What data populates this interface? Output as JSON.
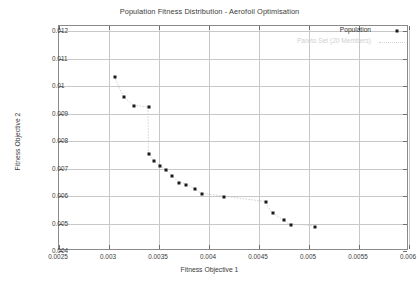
{
  "chart_data": {
    "type": "scatter",
    "title": "Population Fitness Distribution - Aerofoil Optimisation",
    "xlabel": "Fitness Objective 1",
    "ylabel": "Fitness Objective 2",
    "xlim": [
      0.0025,
      0.006
    ],
    "ylim": [
      0.004,
      0.0122
    ],
    "xticks": [
      0.0025,
      0.003,
      0.0035,
      0.004,
      0.0045,
      0.005,
      0.0055,
      0.006
    ],
    "xticklabels": [
      "0.0025",
      "0.003",
      "0.0035",
      "0.004",
      "0.0045",
      "0.005",
      "0.0055",
      "0.006"
    ],
    "yticks": [
      0.004,
      0.005,
      0.006,
      0.007,
      0.008,
      0.009,
      0.01,
      0.011,
      0.012
    ],
    "yticklabels": [
      "0.004",
      "0.005",
      "0.006",
      "0.007",
      "0.008",
      "0.009",
      "0.01",
      "0.011",
      "0.012"
    ],
    "grid": true,
    "legend_position": "top-right",
    "series": [
      {
        "name": "Population",
        "marker": "square",
        "marker_color": "#1a1a1a",
        "points": [
          {
            "x": 0.003055,
            "y": 0.010355
          },
          {
            "x": 0.003145,
            "y": 0.009625
          },
          {
            "x": 0.003245,
            "y": 0.009295
          },
          {
            "x": 0.003395,
            "y": 0.009235
          },
          {
            "x": 0.0034,
            "y": 0.007545
          },
          {
            "x": 0.00345,
            "y": 0.00727
          },
          {
            "x": 0.003505,
            "y": 0.007105
          },
          {
            "x": 0.00357,
            "y": 0.006945
          },
          {
            "x": 0.00363,
            "y": 0.006745
          },
          {
            "x": 0.0037,
            "y": 0.00649
          },
          {
            "x": 0.00377,
            "y": 0.00642
          },
          {
            "x": 0.003855,
            "y": 0.006265
          },
          {
            "x": 0.00393,
            "y": 0.006065
          },
          {
            "x": 0.004145,
            "y": 0.00597
          },
          {
            "x": 0.004565,
            "y": 0.00577
          },
          {
            "x": 0.00464,
            "y": 0.00537
          },
          {
            "x": 0.004745,
            "y": 0.005115
          },
          {
            "x": 0.004815,
            "y": 0.00494
          },
          {
            "x": 0.005055,
            "y": 0.00489
          }
        ]
      },
      {
        "name": "Pareto Set (20 Members)",
        "marker": "none",
        "line": "dotted",
        "line_color": "#d0d0d0"
      }
    ]
  },
  "legend": {
    "population_label": "Population",
    "pareto_label": "Pareto Set (20 Members)"
  }
}
